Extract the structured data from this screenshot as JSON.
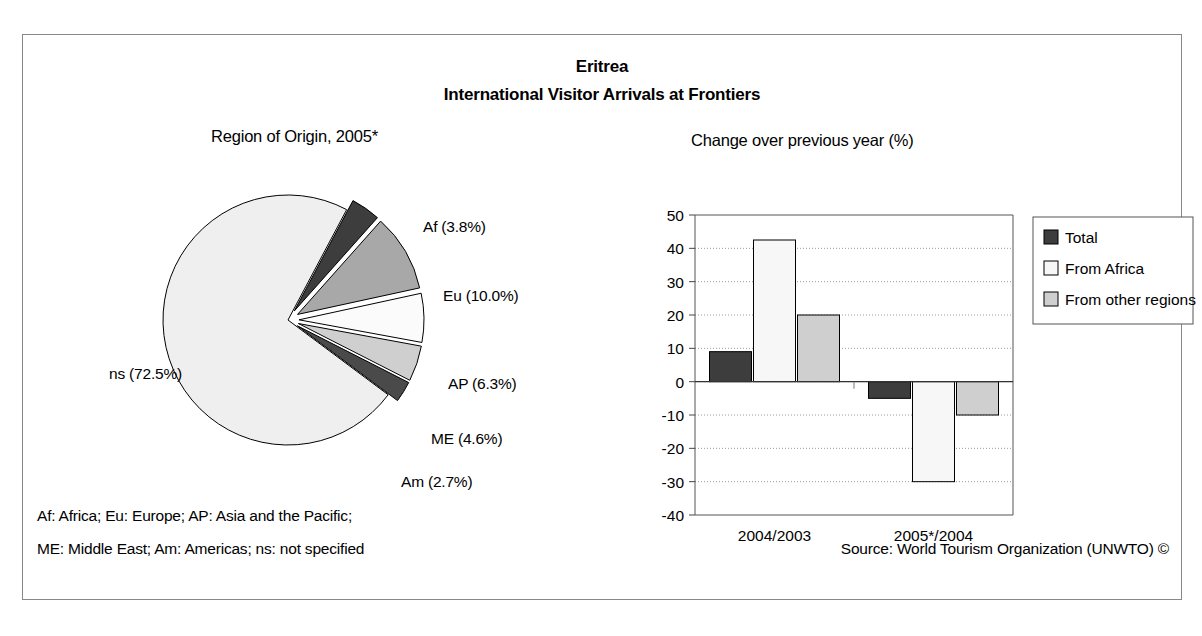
{
  "figure": {
    "country_title": "Eritrea",
    "main_title": "International Visitor Arrivals at Frontiers",
    "footnote_line_1": "Af: Africa; Eu: Europe; AP: Asia and the Pacific;",
    "footnote_line_2": "ME: Middle East; Am: Americas; ns: not specified",
    "source": "Source: World Tourism Organization (UNWTO) ©"
  },
  "colors": {
    "dark": "#3d3d3d",
    "medium_gray": "#a8a8a8",
    "light_gray": "#cfcfcf",
    "very_light": "#efefef",
    "white": "#f7f7f7",
    "outline": "#000000",
    "grid": "#999999"
  },
  "chart_data": [
    {
      "type": "pie",
      "title": "Region of Origin, 2005*",
      "categories": [
        "ns",
        "Af",
        "Eu",
        "AP",
        "ME",
        "Am"
      ],
      "values": [
        72.5,
        3.8,
        10.0,
        6.3,
        4.6,
        2.7
      ],
      "labels": [
        "ns (72.5%)",
        "Af (3.8%)",
        "Eu (10.0%)",
        "AP (6.3%)",
        "ME (4.6%)",
        "Am (2.7%)"
      ],
      "slice_fills": [
        "#efefef",
        "#3d3d3d",
        "#a8a8a8",
        "#fbfbfb",
        "#cfcfcf",
        "#4a4a4a"
      ],
      "exploded": [
        false,
        true,
        true,
        true,
        true,
        true
      ],
      "legend": "none",
      "grid": false
    },
    {
      "type": "bar",
      "title": "Change over previous year (%)",
      "categories": [
        "2004/2003",
        "2005*/2004"
      ],
      "series": [
        {
          "name": "Total",
          "values": [
            9,
            -5
          ],
          "fill": "#3d3d3d"
        },
        {
          "name": "From Africa",
          "values": [
            42.5,
            -30
          ],
          "fill": "#f7f7f7"
        },
        {
          "name": "From other regions",
          "values": [
            20,
            -10
          ],
          "fill": "#cfcfcf"
        }
      ],
      "xlabel": "",
      "ylabel": "",
      "ylim": [
        -40,
        50
      ],
      "yticks": [
        50,
        40,
        30,
        20,
        10,
        0,
        -10,
        -20,
        -30,
        -40
      ],
      "ytick_labels": [
        "50",
        "40",
        "30",
        "20",
        "10",
        "0",
        "-10",
        "-20",
        "-30",
        "-40"
      ],
      "grid": true,
      "legend": [
        "Total",
        "From Africa",
        "From other regions"
      ],
      "legend_position": "right"
    }
  ]
}
